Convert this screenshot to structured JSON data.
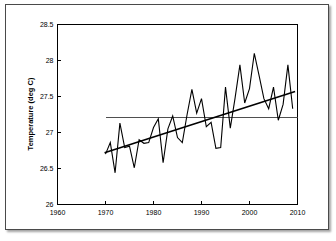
{
  "figure": {
    "background_color": "#ffffff",
    "frame_color": "#4a4a4a",
    "ink_color": "#000000"
  },
  "chart_data": {
    "type": "line",
    "title": "",
    "subtitle": "",
    "xlabel": "",
    "ylabel": "Temperature (deg C)",
    "xlim": [
      1960,
      2010
    ],
    "ylim": [
      26,
      28.5
    ],
    "xticks": [
      1960,
      1970,
      1980,
      1990,
      2000,
      2010
    ],
    "xtick_labels": [
      "1960",
      "1970",
      "1980",
      "1990",
      "2000",
      "2010"
    ],
    "yticks": [
      26,
      26.5,
      27,
      27.5,
      28,
      28.5
    ],
    "ytick_labels": [
      "26",
      "26.5",
      "27",
      "27.5",
      "28",
      "28.5"
    ],
    "grid": false,
    "legend": null,
    "x": [
      1970,
      1971,
      1972,
      1973,
      1974,
      1975,
      1976,
      1977,
      1978,
      1979,
      1980,
      1981,
      1982,
      1983,
      1984,
      1985,
      1986,
      1987,
      1988,
      1989,
      1990,
      1991,
      1992,
      1993,
      1994,
      1995,
      1996,
      1997,
      1998,
      1999,
      2000,
      2001,
      2002,
      2003,
      2004,
      2005,
      2006,
      2007,
      2008,
      2009
    ],
    "series": [
      {
        "name": "Annual mean temperature",
        "style": "thin-line",
        "values": [
          26.7,
          26.86,
          26.44,
          27.13,
          26.79,
          26.81,
          26.51,
          26.9,
          26.85,
          26.86,
          27.07,
          27.19,
          26.58,
          27.05,
          27.23,
          26.93,
          26.86,
          27.25,
          27.6,
          27.27,
          27.47,
          27.08,
          27.14,
          26.78,
          26.79,
          27.63,
          27.06,
          27.48,
          27.94,
          27.41,
          27.61,
          28.1,
          27.79,
          27.47,
          27.33,
          27.63,
          27.17,
          27.39,
          27.94,
          27.33
        ]
      },
      {
        "name": "Linear trend",
        "style": "thick-line",
        "x": [
          1969.8,
          2009.5
        ],
        "values": [
          26.72,
          27.57
        ]
      },
      {
        "name": "Long-term mean",
        "style": "horizontal-reference",
        "x": [
          1970,
          2010
        ],
        "value": 27.21
      }
    ]
  }
}
